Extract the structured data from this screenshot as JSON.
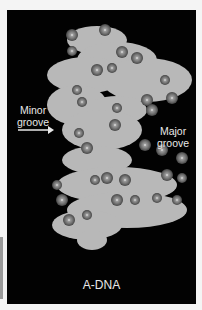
{
  "figure": {
    "title": "A-DNA",
    "labels": {
      "minor_groove": [
        "Minor",
        "groove"
      ],
      "major_groove": [
        "Major",
        "groove"
      ]
    },
    "colors": {
      "background": "#020202",
      "surface": "#b9b9b9",
      "atoms": "#6e6e6e",
      "text": "#e8e8e8"
    }
  }
}
